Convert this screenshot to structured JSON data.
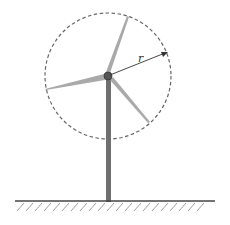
{
  "diagram": {
    "radius_label": "r",
    "colors": {
      "blade": "#a9a9a9",
      "tower": "#6f6f6f",
      "hub": "#555555",
      "circle": "#666666",
      "ground": "#444444",
      "hatch": "#888888",
      "arrow": "#333333"
    }
  }
}
